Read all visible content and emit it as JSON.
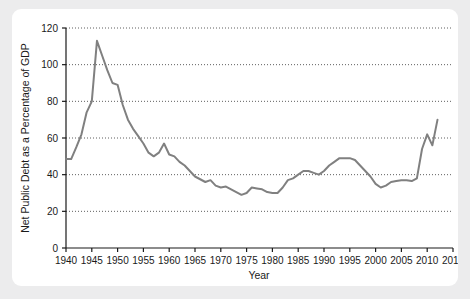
{
  "figure": {
    "background_color": "#ececed",
    "card_color": "#ffffff"
  },
  "chart_data": {
    "type": "line",
    "title": "",
    "xlabel": "Year",
    "ylabel": "Net Public Debt as a Percentage of GDP",
    "xlim": [
      1940,
      2015
    ],
    "ylim": [
      0,
      120
    ],
    "grid": true,
    "grid_axis": "y",
    "legend": "none",
    "line_color": "#808080",
    "line_width": 2,
    "xticks": [
      1940,
      1945,
      1950,
      1955,
      1960,
      1965,
      1970,
      1975,
      1980,
      1985,
      1990,
      1995,
      2000,
      2005,
      2010,
      2015
    ],
    "yticks": [
      0,
      20,
      40,
      60,
      80,
      100,
      120
    ],
    "x": [
      1940,
      1941,
      1942,
      1943,
      1944,
      1945,
      1946,
      1947,
      1948,
      1949,
      1950,
      1951,
      1952,
      1953,
      1954,
      1955,
      1956,
      1957,
      1958,
      1959,
      1960,
      1961,
      1962,
      1963,
      1964,
      1965,
      1966,
      1967,
      1968,
      1969,
      1970,
      1971,
      1972,
      1973,
      1974,
      1975,
      1976,
      1977,
      1978,
      1979,
      1980,
      1981,
      1982,
      1983,
      1984,
      1985,
      1986,
      1987,
      1988,
      1989,
      1990,
      1991,
      1992,
      1993,
      1994,
      1995,
      1996,
      1997,
      1998,
      1999,
      2000,
      2001,
      2002,
      2003,
      2004,
      2005,
      2006,
      2007,
      2008,
      2009,
      2010,
      2011,
      2012
    ],
    "values": [
      48.5,
      48.5,
      55,
      62,
      74,
      80,
      113,
      105,
      97,
      90,
      89,
      78,
      70,
      65,
      61,
      57,
      52,
      50,
      52,
      57,
      51,
      50,
      47,
      45,
      42,
      39,
      37.5,
      36,
      37,
      34,
      33,
      33.5,
      32,
      30.5,
      29,
      30,
      33,
      32.5,
      32,
      30.5,
      30,
      30,
      33,
      37,
      38,
      40,
      42,
      42,
      41,
      40,
      42,
      45,
      47,
      49,
      49,
      49,
      48,
      45,
      42,
      39,
      35,
      33,
      34,
      36,
      36.5,
      37,
      37,
      36.5,
      38,
      54,
      62,
      56,
      70
    ]
  }
}
